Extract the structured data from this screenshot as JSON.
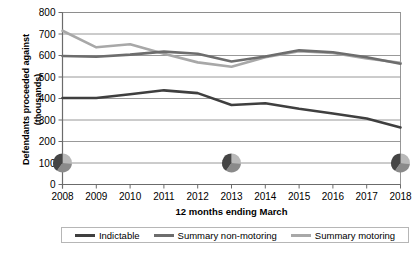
{
  "chart_data": {
    "type": "line",
    "title": "",
    "xlabel": "12 months ending March",
    "ylabel": "Defendants proceeded against (thousands)",
    "ylabel_line1": "Defendants proceeded against",
    "ylabel_line2": "(thousands)",
    "categories": [
      "2008",
      "2009",
      "2010",
      "2011",
      "2012",
      "2013",
      "2014",
      "2015",
      "2016",
      "2017",
      "2018"
    ],
    "x": [
      2008,
      2009,
      2010,
      2011,
      2012,
      2013,
      2014,
      2015,
      2016,
      2017,
      2018
    ],
    "ylim": [
      0,
      800
    ],
    "yticks": [
      "0",
      "100",
      "200",
      "300",
      "400",
      "500",
      "600",
      "700",
      "800"
    ],
    "ytick_values": [
      0,
      100,
      200,
      300,
      400,
      500,
      600,
      700,
      800
    ],
    "grid": true,
    "grid_axis": "y",
    "legend_position": "bottom",
    "series": [
      {
        "name": "Indictable",
        "color": "#3f3f3f",
        "values": [
          402,
          402,
          420,
          438,
          425,
          370,
          378,
          352,
          330,
          307,
          265
        ]
      },
      {
        "name": "Summary non-motoring",
        "color": "#6d6d6d",
        "values": [
          598,
          594,
          604,
          618,
          608,
          572,
          595,
          624,
          615,
          592,
          562
        ]
      },
      {
        "name": "Summary motoring",
        "color": "#a8a8a8",
        "values": [
          715,
          638,
          652,
          608,
          568,
          548,
          592,
          620,
          612,
          586,
          566
        ]
      }
    ],
    "annotations": [
      {
        "name": "pie-marker",
        "x": 2008,
        "y": 100
      },
      {
        "name": "pie-marker",
        "x": 2013,
        "y": 100
      },
      {
        "name": "pie-marker",
        "x": 2018,
        "y": 100
      }
    ]
  },
  "legend": {
    "items": [
      {
        "label": "Indictable",
        "color": "#3f3f3f"
      },
      {
        "label": "Summary non-motoring",
        "color": "#6d6d6d"
      },
      {
        "label": "Summary motoring",
        "color": "#a8a8a8"
      }
    ]
  },
  "colors": {
    "indictable": "#3f3f3f",
    "summary_non_motoring": "#6d6d6d",
    "summary_motoring": "#a8a8a8",
    "gridline": "#8d8d8d",
    "axis": "#6b6b6b"
  },
  "caption": ""
}
